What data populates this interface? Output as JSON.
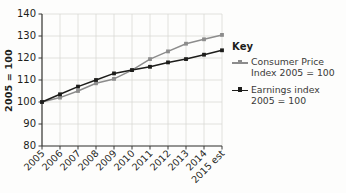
{
  "chart_data": {
    "type": "line",
    "title": "",
    "xlabel": "",
    "ylabel": "2005 = 100",
    "ylim": [
      80,
      140
    ],
    "ytick_step": 10,
    "yticks": [
      "80",
      "90",
      "100",
      "110",
      "120",
      "130",
      "140"
    ],
    "grid": true,
    "legend_position": "right",
    "categories": [
      "2005",
      "2006",
      "2007",
      "2008",
      "2009",
      "2010",
      "2011",
      "2012",
      "2013",
      "2014",
      "2015 est"
    ],
    "series": [
      {
        "name": "Consumer Price Index 2005 = 100",
        "color": "#8c8c8c",
        "values": [
          100,
          102,
          105,
          108.5,
          110.5,
          114.5,
          119.5,
          123,
          126.5,
          128.5,
          130.5
        ]
      },
      {
        "name": "Earnings index 2005 = 100",
        "color": "#1d1d1b",
        "values": [
          100,
          103.5,
          107,
          110,
          113,
          114.5,
          116,
          118,
          119.5,
          121.5,
          123.5
        ]
      }
    ]
  },
  "axis": {
    "y_title": "2005 = 100"
  },
  "legend": {
    "title": "Key",
    "items": [
      {
        "label_line1": "Consumer Price",
        "label_line2": "Index 2005 = 100",
        "color": "#8c8c8c"
      },
      {
        "label_line1": "Earnings index",
        "label_line2": "2005 = 100",
        "color": "#1d1d1b"
      }
    ]
  },
  "colors": {
    "grid": "#d9d9d6",
    "axis": "#3a3a38",
    "background": "#fdfdfc",
    "text": "#1d1d1b"
  }
}
